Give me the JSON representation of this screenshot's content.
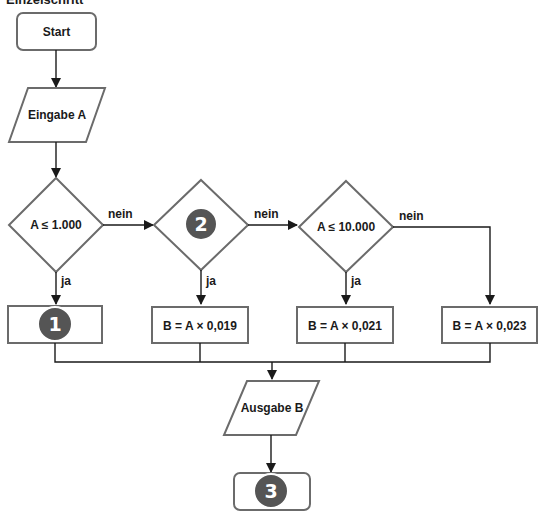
{
  "title": "Einzelschritt",
  "colors": {
    "stroke": "#6b6b6b",
    "line": "#1a1a1a",
    "badge": "#555555",
    "badge_text": "#ffffff"
  },
  "nodes": {
    "start": {
      "label": "Start",
      "type": "terminal"
    },
    "input": {
      "label": "Eingabe A",
      "type": "io"
    },
    "decision1": {
      "label": "A ≤ 1.000",
      "type": "decision"
    },
    "decision2": {
      "label": "",
      "badge": "2",
      "type": "decision"
    },
    "decision3": {
      "label": "A ≤ 10.000",
      "type": "decision"
    },
    "process1": {
      "label": "",
      "badge": "1",
      "type": "process"
    },
    "process2": {
      "label": "B = A × 0,019",
      "type": "process"
    },
    "process3": {
      "label": "B = A × 0,021",
      "type": "process"
    },
    "process4": {
      "label": "B = A × 0,023",
      "type": "process"
    },
    "output": {
      "label": "Ausgabe B",
      "type": "io"
    },
    "end": {
      "label": "",
      "badge": "3",
      "type": "terminal"
    }
  },
  "edges": {
    "yes_label": "ja",
    "no_label": "nein"
  }
}
